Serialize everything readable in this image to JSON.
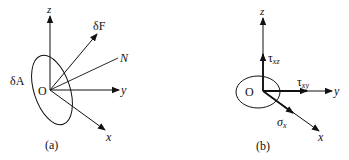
{
  "panels": [
    {
      "id": "a",
      "caption": "(a)",
      "origin_label": "O",
      "area_label": "δA",
      "axes": {
        "x": "x",
        "y": "y",
        "z": "z"
      },
      "vectors": {
        "force": "δF",
        "normal": "N"
      }
    },
    {
      "id": "b",
      "caption": "(b)",
      "origin_label": "O",
      "axes": {
        "x": "x",
        "y": "y",
        "z": "z"
      },
      "stresses": {
        "tau_xz": {
          "symbol": "τ",
          "sub": "xz"
        },
        "tau_xy": {
          "symbol": "τ",
          "sub": "xy"
        },
        "sigma_x": {
          "symbol": "σ",
          "sub": "x"
        }
      }
    }
  ],
  "colors": {
    "ink": "#111111",
    "background": "#ffffff"
  }
}
